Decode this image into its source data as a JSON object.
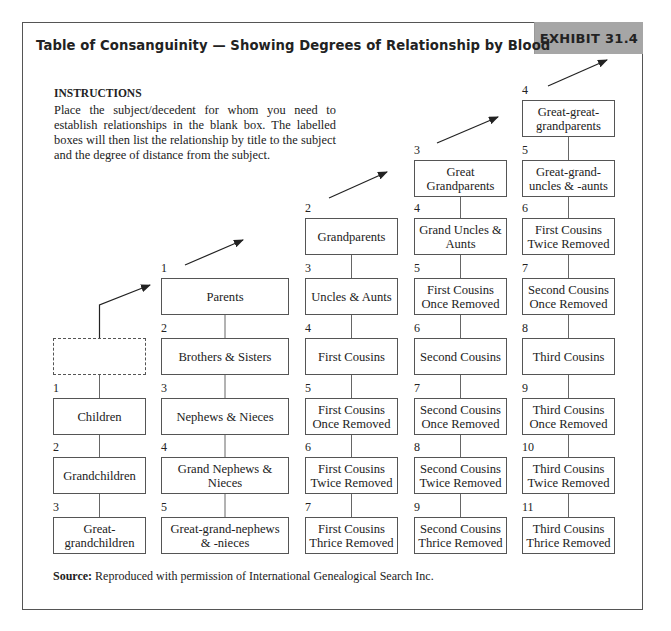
{
  "header": {
    "title": "Table of Consanguinity — Showing Degrees of Relationship by Blood",
    "exhibit": "EXHIBIT 31.4"
  },
  "instructions": {
    "heading": "INSTRUCTIONS",
    "body": "Place the subject/decedent for whom you need to establish relationships in the blank box. The labelled boxes will then list the relationship by title to the subject and the degree of distance from the subject."
  },
  "source": {
    "label": "Source:",
    "text": "Reproduced with permission of International Genealogical Search Inc."
  },
  "columns": [
    {
      "name": "descendants",
      "boxes": [
        {
          "degree": "",
          "label": "",
          "blank": true
        },
        {
          "degree": "1",
          "label": "Children"
        },
        {
          "degree": "2",
          "label": "Grandchildren"
        },
        {
          "degree": "3",
          "label": "Great-grandchildren"
        }
      ]
    },
    {
      "name": "parents-line",
      "boxes": [
        {
          "degree": "1",
          "label": "Parents"
        },
        {
          "degree": "2",
          "label": "Brothers & Sisters"
        },
        {
          "degree": "3",
          "label": "Nephews & Nieces"
        },
        {
          "degree": "4",
          "label": "Grand Nephews & Nieces"
        },
        {
          "degree": "5",
          "label": "Great-grand-nephews & -nieces"
        }
      ]
    },
    {
      "name": "grandparents-line",
      "boxes": [
        {
          "degree": "2",
          "label": "Grandparents"
        },
        {
          "degree": "3",
          "label": "Uncles & Aunts"
        },
        {
          "degree": "4",
          "label": "First Cousins"
        },
        {
          "degree": "5",
          "label": "First Cousins Once Removed"
        },
        {
          "degree": "6",
          "label": "First Cousins Twice Removed"
        },
        {
          "degree": "7",
          "label": "First Cousins Thrice Removed"
        }
      ]
    },
    {
      "name": "great-grandparents-line",
      "boxes": [
        {
          "degree": "3",
          "label": "Great Grandparents"
        },
        {
          "degree": "4",
          "label": "Grand Uncles & Aunts"
        },
        {
          "degree": "5",
          "label": "First Cousins Once Removed"
        },
        {
          "degree": "6",
          "label": "Second Cousins"
        },
        {
          "degree": "7",
          "label": "Second Cousins Once Removed"
        },
        {
          "degree": "8",
          "label": "Second Cousins Twice Removed"
        },
        {
          "degree": "9",
          "label": "Second Cousins Thrice Removed"
        }
      ]
    },
    {
      "name": "great-great-grandparents-line",
      "boxes": [
        {
          "degree": "4",
          "label": "Great-great-grandparents"
        },
        {
          "degree": "5",
          "label": "Great-grand-uncles & -aunts"
        },
        {
          "degree": "6",
          "label": "First Cousins Twice Removed"
        },
        {
          "degree": "7",
          "label": "Second Cousins Once Removed"
        },
        {
          "degree": "8",
          "label": "Third Cousins"
        },
        {
          "degree": "9",
          "label": "Third Cousins Once Removed"
        },
        {
          "degree": "10",
          "label": "Third Cousins Twice Removed"
        },
        {
          "degree": "11",
          "label": "Third Cousins Thrice Removed"
        }
      ]
    }
  ]
}
